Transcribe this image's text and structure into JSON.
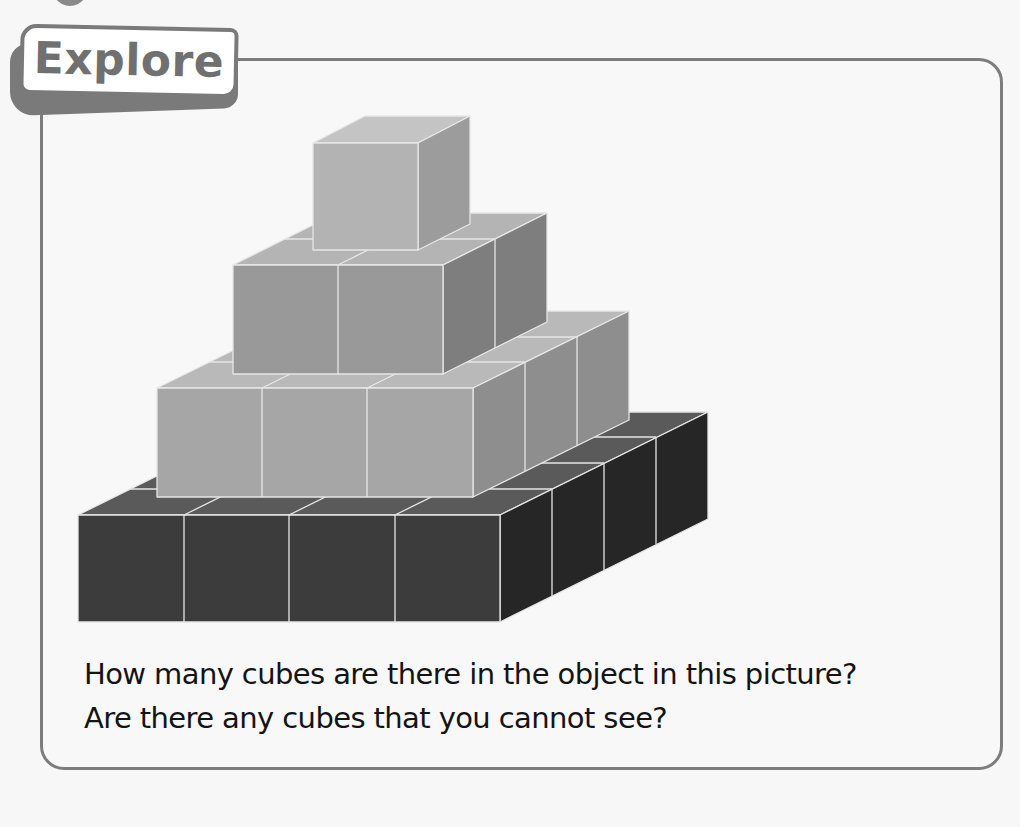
{
  "section": {
    "tag_label": "Explore",
    "questions": [
      "How many cubes are there in the object in this picture?",
      "Are there any cubes that you cannot see?"
    ]
  },
  "figure": {
    "tiers": [
      {
        "name": "base",
        "size": "4x4",
        "color": "#3a3a3a"
      },
      {
        "name": "second",
        "size": "3x3",
        "color": "#a4a4a4"
      },
      {
        "name": "third",
        "size": "2x2",
        "color": "#999999"
      },
      {
        "name": "top",
        "size": "1x1",
        "color": "#b2b2b2"
      }
    ]
  },
  "colors": {
    "border": "#7d7d7d",
    "background": "#f8f8f8",
    "text": "#141414"
  }
}
